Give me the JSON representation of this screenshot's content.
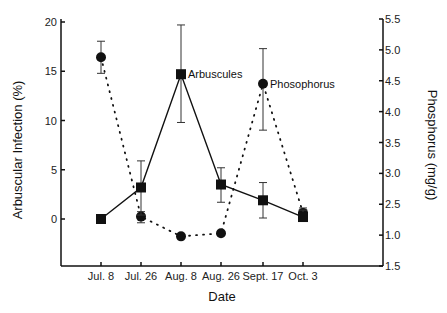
{
  "chart_data": {
    "type": "line",
    "title": "",
    "xlabel": "Date",
    "ylabel": "Arbuscular Infection (%)",
    "y2label": "Phosphorus (mg/g)",
    "categories": [
      "Jul. 8",
      "Jul. 26",
      "Aug. 8",
      "Aug. 26",
      "Sept. 17",
      "Oct. 3"
    ],
    "ylim": [
      -4.7,
      20
    ],
    "y2lim": [
      1.5,
      5.5
    ],
    "yticks": [
      "20",
      "15",
      "10",
      "5",
      "0"
    ],
    "y2ticks": [
      "5.5",
      "5.0",
      "4.5",
      "4.0",
      "3.5",
      "3.0",
      "2.5",
      "1.0",
      "1.5"
    ],
    "grid": false,
    "legend": "inline annotations",
    "series": [
      {
        "name": "Arbuscules",
        "axis": "left",
        "marker": "square",
        "line": "solid",
        "values": [
          0.0,
          3.2,
          14.7,
          3.5,
          1.9,
          0.2
        ],
        "err_upper": [
          0.0,
          5.9,
          19.7,
          5.2,
          3.7,
          0.9
        ],
        "err_lower": [
          0.0,
          0.4,
          9.8,
          1.7,
          0.1,
          -0.2
        ]
      },
      {
        "name": "Phosophorus",
        "axis": "right",
        "marker": "circle",
        "line": "dotted",
        "values": [
          4.88,
          2.3,
          1.98,
          2.03,
          4.45,
          2.36
        ],
        "err_upper": [
          5.14,
          2.38,
          1.98,
          2.03,
          5.02,
          2.44
        ],
        "err_lower": [
          4.62,
          2.2,
          1.98,
          2.03,
          3.7,
          2.3
        ]
      }
    ],
    "annotations": [
      "Arbuscules",
      "Phosophorus"
    ]
  },
  "labels": {
    "xlabel": "Date",
    "ylabel": "Arbuscular Infection (%)",
    "y2label": "Phosphorus (mg/g)",
    "annot_arb": "Arbuscules",
    "annot_phos": "Phosophorus"
  }
}
